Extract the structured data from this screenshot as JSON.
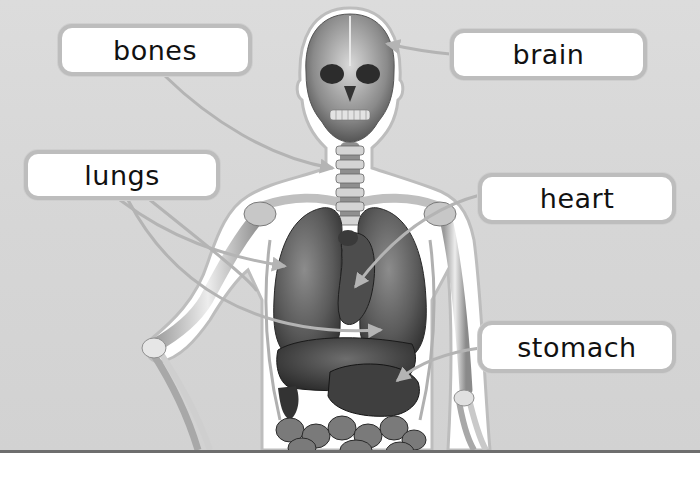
{
  "diagram": {
    "labels": [
      {
        "id": "bones",
        "text": "bones",
        "box": [
          58,
          24,
          194,
          52
        ],
        "points_to": "neck vertebrae"
      },
      {
        "id": "brain",
        "text": "brain",
        "box": [
          450,
          29,
          197,
          51
        ],
        "points_to": "skull / brain"
      },
      {
        "id": "lungs",
        "text": "lungs",
        "box": [
          24,
          150,
          196,
          50
        ],
        "points_to": "lungs"
      },
      {
        "id": "heart",
        "text": "heart",
        "box": [
          478,
          173,
          198,
          51
        ],
        "points_to": "heart"
      },
      {
        "id": "stomach",
        "text": "stomach",
        "box": [
          478,
          321,
          198,
          52
        ],
        "points_to": "stomach"
      }
    ]
  },
  "colors": {
    "background": "#d8d8d8",
    "label_fill": "#ffffff",
    "label_border": "#bdbdbd",
    "leader_line": "#b4b4b4",
    "text": "#111111",
    "baseline": "#6e6e6e"
  }
}
